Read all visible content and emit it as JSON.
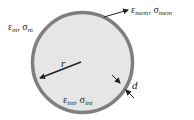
{
  "diagram": {
    "type": "cell-shell-model",
    "labels": {
      "medium": {
        "eps": "ε",
        "eps_sub": "m",
        "sep": ", ",
        "sig": "σ",
        "sig_sub": "m"
      },
      "membrane": {
        "eps": "ε",
        "eps_sub": "mem",
        "sep": ", ",
        "sig": "σ",
        "sig_sub": "mem"
      },
      "interior": {
        "eps": "ε",
        "eps_sub": "int",
        "sep": ", ",
        "sig": "σ",
        "sig_sub": "int"
      },
      "radius": "r",
      "thickness": "d"
    },
    "colors": {
      "shell": "#7f7f7f",
      "interior": "#e6e6e6",
      "arrow": "#222222",
      "background": "#ffffff"
    }
  }
}
